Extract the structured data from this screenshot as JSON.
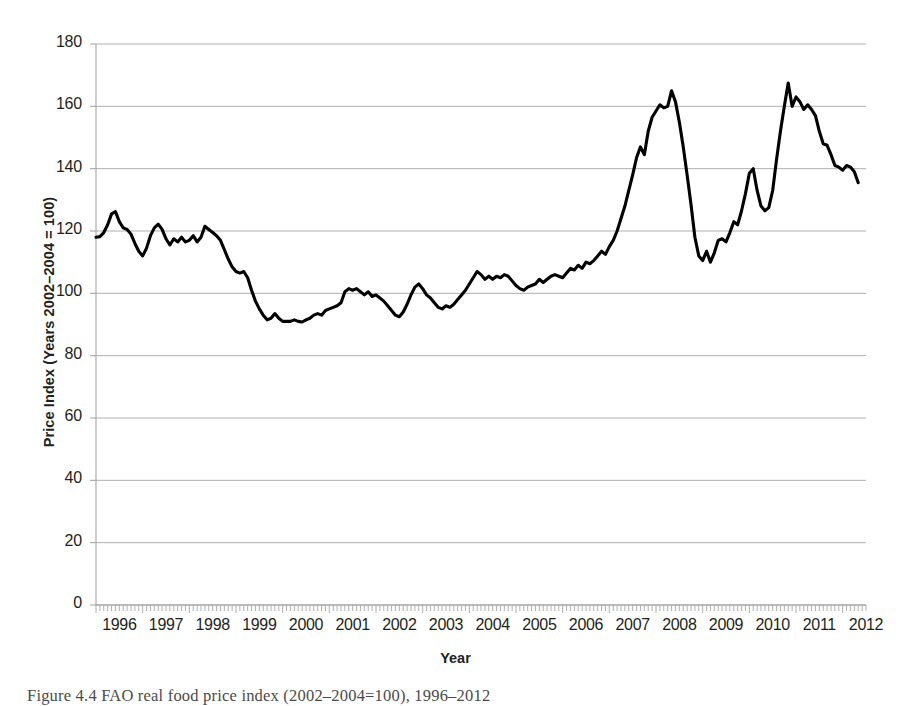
{
  "figure": {
    "caption": "Figure 4.4 FAO real food price index (2002–2004=100), 1996–2012"
  },
  "axis": {
    "y_title": "Price Index (Years 2002–2004 = 100)",
    "x_title": "Year"
  },
  "colors": {
    "line": "#000000",
    "grid": "#a6a6a6",
    "axis": "#a6a6a6",
    "text": "#231f20",
    "caption": "#4a4a4a",
    "background": "#ffffff"
  },
  "chart_data": {
    "type": "line",
    "title": "",
    "subtitle": "",
    "xlabel": "Year",
    "ylabel": "Price Index (Years 2002-2004 = 100)",
    "xlim": [
      1996,
      2012.5
    ],
    "ylim": [
      0,
      180
    ],
    "ytick_labels": [
      "0",
      "20",
      "40",
      "60",
      "80",
      "100",
      "120",
      "140",
      "160",
      "180"
    ],
    "ytick_values": [
      0,
      20,
      40,
      60,
      80,
      100,
      120,
      140,
      160,
      180
    ],
    "xtick_labels": [
      "1996",
      "1997",
      "1998",
      "1999",
      "2000",
      "2001",
      "2002",
      "2003",
      "2004",
      "2005",
      "2006",
      "2007",
      "2008",
      "2009",
      "2010",
      "2011",
      "2012"
    ],
    "xtick_values": [
      1996,
      1997,
      1998,
      1999,
      2000,
      2001,
      2002,
      2003,
      2004,
      2005,
      2006,
      2007,
      2008,
      2009,
      2010,
      2011,
      2012
    ],
    "minor_xticks": "monthly",
    "grid": "horizontal",
    "legend": "none",
    "series": [
      {
        "name": "FAO real food price index",
        "color": "#000000",
        "x_start": 1996.0,
        "x_step": 0.0833333,
        "values": [
          118.0,
          118.2,
          119.5,
          122.0,
          125.5,
          126.2,
          123.0,
          121.0,
          120.5,
          119.0,
          116.0,
          113.5,
          112.0,
          114.5,
          118.5,
          121.0,
          122.2,
          120.5,
          117.5,
          115.5,
          117.5,
          116.5,
          118.0,
          116.5,
          117.0,
          118.5,
          116.5,
          118.0,
          121.5,
          120.5,
          119.5,
          118.5,
          117.0,
          114.0,
          111.0,
          108.5,
          107.0,
          106.5,
          107.0,
          105.0,
          101.0,
          97.5,
          95.0,
          93.0,
          91.5,
          92.0,
          93.5,
          92.0,
          91.0,
          91.0,
          91.0,
          91.5,
          91.0,
          90.8,
          91.5,
          92.0,
          93.0,
          93.5,
          93.0,
          94.5,
          95.0,
          95.5,
          96.0,
          97.0,
          100.5,
          101.5,
          101.0,
          101.5,
          100.5,
          99.5,
          100.5,
          99.0,
          99.5,
          98.5,
          97.5,
          96.0,
          94.5,
          93.0,
          92.5,
          94.0,
          96.5,
          99.5,
          102.0,
          103.0,
          101.5,
          99.5,
          98.5,
          97.0,
          95.5,
          95.0,
          96.0,
          95.5,
          96.5,
          98.0,
          99.5,
          101.0,
          103.0,
          105.0,
          107.0,
          106.0,
          104.5,
          105.5,
          104.5,
          105.5,
          105.0,
          106.0,
          105.5,
          104.0,
          102.5,
          101.5,
          101.0,
          102.0,
          102.5,
          103.0,
          104.5,
          103.5,
          104.5,
          105.5,
          106.0,
          105.5,
          105.0,
          106.5,
          108.0,
          107.5,
          109.0,
          108.0,
          110.0,
          109.5,
          110.5,
          112.0,
          113.5,
          112.5,
          115.0,
          117.0,
          120.0,
          124.0,
          128.0,
          133.0,
          138.0,
          143.5,
          147.0,
          144.5,
          152.0,
          156.5,
          158.5,
          160.5,
          159.5,
          160.0,
          165.0,
          161.5,
          155.0,
          147.0,
          138.0,
          128.5,
          118.0,
          112.0,
          110.5,
          113.5,
          110.0,
          113.0,
          117.0,
          117.5,
          116.5,
          119.5,
          123.0,
          122.0,
          126.5,
          132.0,
          138.5,
          140.0,
          133.0,
          128.0,
          126.5,
          127.5,
          133.0,
          143.0,
          152.0,
          160.0,
          167.5,
          160.0,
          163.0,
          161.5,
          159.0,
          160.5,
          159.0,
          157.0,
          152.0,
          148.0,
          147.5,
          144.5,
          141.0,
          140.5,
          139.5,
          141.0,
          140.5,
          139.0,
          135.5
        ]
      }
    ]
  }
}
